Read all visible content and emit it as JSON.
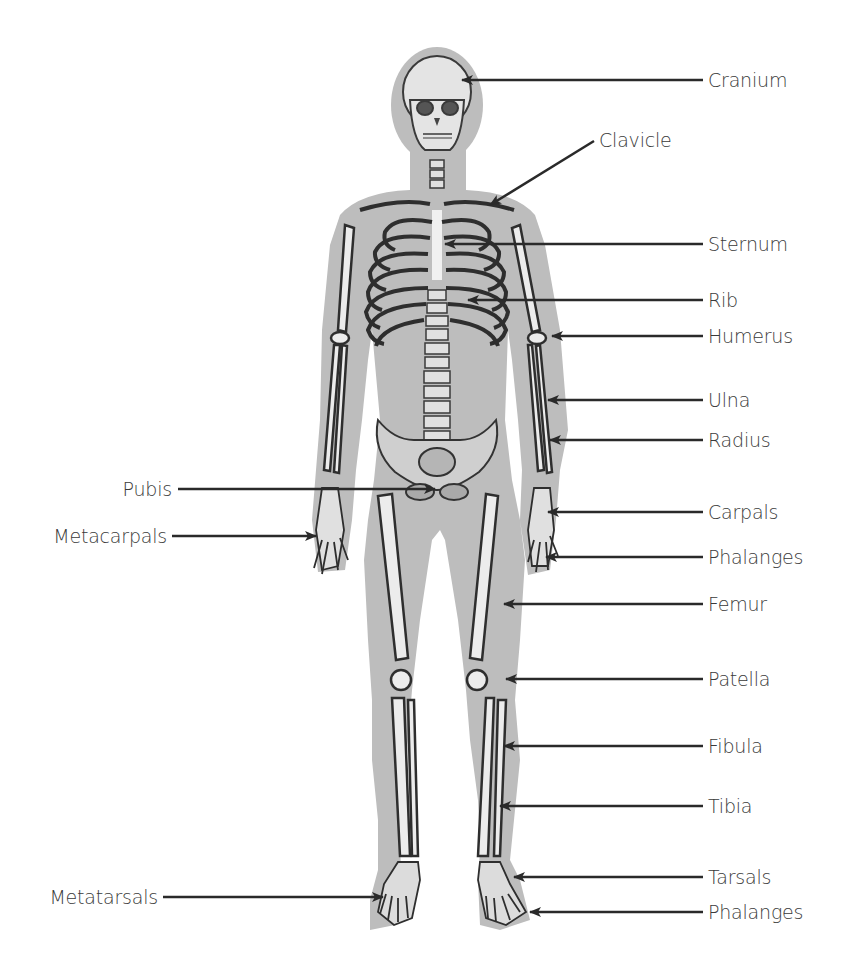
{
  "colors": {
    "silhouette": "#bdbdbd",
    "bone": "#e8e8e8",
    "bone_shadow": "#4a4a4a",
    "arrow": "#2a2a2a",
    "text": "#3a3a3a"
  },
  "labels_right": [
    {
      "text": "Cranium",
      "y": 80
    },
    {
      "text": "Clavicle",
      "y": 140
    },
    {
      "text": "Sternum",
      "y": 244
    },
    {
      "text": "Rib",
      "y": 300
    },
    {
      "text": "Humerus",
      "y": 336
    },
    {
      "text": "Ulna",
      "y": 400
    },
    {
      "text": "Radius",
      "y": 440
    },
    {
      "text": "Carpals",
      "y": 512
    },
    {
      "text": "Phalanges",
      "y": 557
    },
    {
      "text": "Femur",
      "y": 604
    },
    {
      "text": "Patella",
      "y": 679
    },
    {
      "text": "Fibula",
      "y": 746
    },
    {
      "text": "Tibia",
      "y": 806
    },
    {
      "text": "Tarsals",
      "y": 877
    },
    {
      "text": "Phalanges",
      "y": 912
    }
  ],
  "labels_left": [
    {
      "text": "Pubis",
      "y": 489
    },
    {
      "text": "Metacarpals",
      "y": 536
    },
    {
      "text": "Metatarsals",
      "y": 897
    }
  ]
}
